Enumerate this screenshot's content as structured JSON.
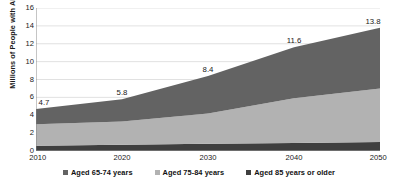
{
  "chart_data": {
    "type": "area",
    "stacked": true,
    "title": "",
    "xlabel": "",
    "ylabel": "Millions of People with Alzheimer's",
    "x": [
      2010,
      2020,
      2030,
      2040,
      2050
    ],
    "xticklabels": [
      "2010",
      "2020",
      "2030",
      "2040",
      "2050"
    ],
    "yticks": [
      0,
      2,
      4,
      6,
      8,
      10,
      12,
      14,
      16
    ],
    "yticklabels": [
      "0",
      "2",
      "4",
      "6",
      "8",
      "10",
      "12",
      "14",
      "16"
    ],
    "ylim": [
      0,
      16
    ],
    "grid": "horizontal",
    "legend_position": "bottom",
    "series": [
      {
        "name": "Aged 85 years or older",
        "color": "#3f3f3f",
        "stack_order": 1,
        "values": [
          0.6,
          0.7,
          0.8,
          0.9,
          1.0
        ]
      },
      {
        "name": "Aged 75-84 years",
        "color": "#b2b2b2",
        "stack_order": 2,
        "values": [
          2.4,
          2.6,
          3.4,
          5.0,
          6.0
        ]
      },
      {
        "name": "Aged 65-74 years",
        "color": "#636363",
        "stack_order": 3,
        "values": [
          1.7,
          2.5,
          4.2,
          5.7,
          6.8
        ]
      }
    ],
    "totals": [
      4.7,
      5.8,
      8.4,
      11.6,
      13.8
    ],
    "data_labels": [
      "4.7",
      "5.8",
      "8.4",
      "11.6",
      "13.8"
    ]
  },
  "legend": {
    "items": [
      {
        "label": "Aged 65-74 years",
        "color": "#636363"
      },
      {
        "label": "Aged 75-84 years",
        "color": "#b2b2b2"
      },
      {
        "label": "Aged 85 years or older",
        "color": "#3f3f3f"
      }
    ]
  },
  "colors": {
    "axis": "#7f7f7f",
    "gridline": "#d9d9d9",
    "text": "#1a1a1a",
    "background": "#ffffff"
  }
}
